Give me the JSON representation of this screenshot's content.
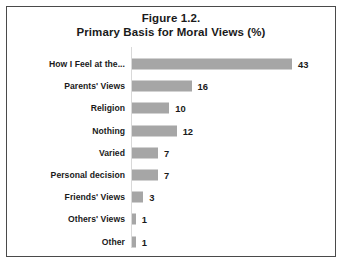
{
  "figure": {
    "title_line1": "Figure 1.2.",
    "title_line2": "Primary Basis for Moral Views (%)",
    "frame_border_color": "#4a4a4a",
    "background_color": "#ffffff"
  },
  "chart_data": {
    "type": "bar",
    "orientation": "horizontal",
    "title": "Figure 1.2. Primary Basis for Moral Views (%)",
    "subtitle": "Primary Basis for Moral Views (%)",
    "xlabel": "",
    "ylabel": "",
    "xlim": [
      0,
      43
    ],
    "grid": false,
    "legend": false,
    "bar_color": "#a6a6a6",
    "data_labels": true,
    "categories": [
      "How I Feel at the...",
      "Parents' Views",
      "Religion",
      "Nothing",
      "Varied",
      "Personal decision",
      "Friends' Views",
      "Others' Views",
      "Other"
    ],
    "values": [
      43,
      16,
      10,
      12,
      7,
      7,
      3,
      1,
      1
    ],
    "value_labels": [
      "43",
      "16",
      "10",
      "12",
      "7",
      "7",
      "3",
      "1",
      "1"
    ]
  }
}
